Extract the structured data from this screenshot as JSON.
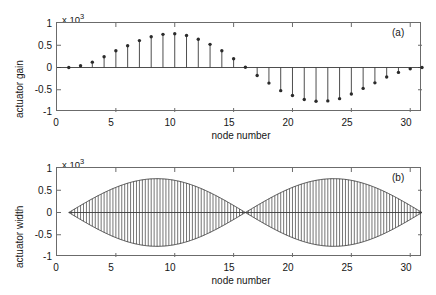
{
  "figure": {
    "background": "#ffffff",
    "axis_color": "#6b6b6b",
    "data_color": "#3a3a3a",
    "marker_color": "#2b2b2b"
  },
  "panels": [
    {
      "tag": "(a)",
      "ylabel": "actuator gain",
      "xlabel": "node number",
      "exp_prefix": "x 10",
      "exp_power": "3"
    },
    {
      "tag": "(b)",
      "ylabel": "actuator width",
      "xlabel": "node number",
      "exp_prefix": "x 10",
      "exp_power": "3"
    }
  ],
  "chart_data": [
    {
      "type": "scatter",
      "subtype": "stem",
      "panel": "(a)",
      "title": "",
      "xlabel": "node number",
      "ylabel": "actuator gain",
      "y_multiplier": 1000,
      "y_multiplier_label": "x 10^3",
      "xlim": [
        0,
        31
      ],
      "ylim": [
        -1000,
        1000
      ],
      "xticks": [
        0,
        5,
        10,
        15,
        20,
        25,
        30
      ],
      "xticklabels": [
        "0",
        "5",
        "10",
        "15",
        "20",
        "25",
        "30"
      ],
      "yticks": [
        -1000,
        -500,
        0,
        500,
        1000
      ],
      "yticklabels": [
        "-1",
        "-0.5",
        "0",
        "0.5",
        "1"
      ],
      "grid": false,
      "legend": false,
      "x": [
        1,
        2,
        3,
        4,
        5,
        6,
        7,
        8,
        9,
        10,
        11,
        12,
        13,
        14,
        15,
        16,
        17,
        18,
        19,
        20,
        21,
        22,
        23,
        24,
        25,
        26,
        27,
        28,
        29,
        30,
        31
      ],
      "values": [
        0,
        40,
        120,
        240,
        375,
        490,
        605,
        690,
        745,
        760,
        720,
        635,
        520,
        375,
        195,
        5,
        -180,
        -350,
        -520,
        -630,
        -720,
        -760,
        -750,
        -700,
        -595,
        -470,
        -345,
        -215,
        -110,
        -30,
        0
      ]
    },
    {
      "type": "area",
      "subtype": "dense-stem-envelope",
      "panel": "(b)",
      "title": "",
      "xlabel": "node number",
      "ylabel": "actuator width",
      "y_multiplier": 1000,
      "y_multiplier_label": "x 10^3",
      "xlim": [
        0,
        31
      ],
      "ylim": [
        -1000,
        1000
      ],
      "xticks": [
        0,
        5,
        10,
        15,
        20,
        25,
        30
      ],
      "xticklabels": [
        "0",
        "5",
        "10",
        "15",
        "20",
        "25",
        "30"
      ],
      "yticks": [
        -1000,
        -500,
        0,
        500,
        1000
      ],
      "yticklabels": [
        "-1",
        "-0.5",
        "0",
        "0.5",
        "1"
      ],
      "grid": false,
      "legend": false,
      "description": "Dense vertical stems between +envelope and -envelope; envelope has two lobes peaking near node 10 and node 22 at about +/-760, crossing zero at nodes 1, 16 and 31.",
      "stem_count": 121,
      "envelope_peak": 760,
      "envelope_zero_nodes": [
        1,
        16,
        31
      ],
      "envelope_peak_nodes": [
        9.5,
        22.5
      ]
    }
  ]
}
